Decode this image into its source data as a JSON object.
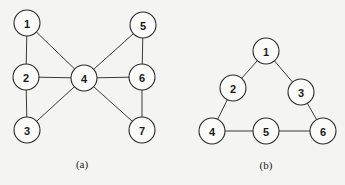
{
  "graphs": [
    {
      "id": "a",
      "caption": "(a)",
      "caption_pos": [
        82,
        164
      ],
      "nodes": [
        {
          "label": "1",
          "x": 27,
          "y": 23
        },
        {
          "label": "2",
          "x": 26,
          "y": 77
        },
        {
          "label": "3",
          "x": 27,
          "y": 130
        },
        {
          "label": "4",
          "x": 84,
          "y": 78
        },
        {
          "label": "5",
          "x": 143,
          "y": 25
        },
        {
          "label": "6",
          "x": 142,
          "y": 77
        },
        {
          "label": "7",
          "x": 142,
          "y": 130
        }
      ],
      "edges": [
        [
          "1",
          "2"
        ],
        [
          "2",
          "3"
        ],
        [
          "1",
          "4"
        ],
        [
          "2",
          "4"
        ],
        [
          "3",
          "4"
        ],
        [
          "4",
          "5"
        ],
        [
          "4",
          "6"
        ],
        [
          "4",
          "7"
        ],
        [
          "5",
          "6"
        ],
        [
          "6",
          "7"
        ]
      ]
    },
    {
      "id": "b",
      "caption": "(b)",
      "caption_pos": [
        266,
        165
      ],
      "nodes": [
        {
          "label": "1",
          "x": 266,
          "y": 51
        },
        {
          "label": "2",
          "x": 233,
          "y": 88
        },
        {
          "label": "3",
          "x": 301,
          "y": 92
        },
        {
          "label": "4",
          "x": 212,
          "y": 131
        },
        {
          "label": "5",
          "x": 266,
          "y": 131
        },
        {
          "label": "6",
          "x": 323,
          "y": 131
        }
      ],
      "edges": [
        [
          "1",
          "2"
        ],
        [
          "1",
          "3"
        ],
        [
          "2",
          "4"
        ],
        [
          "3",
          "6"
        ],
        [
          "4",
          "5"
        ],
        [
          "5",
          "6"
        ]
      ]
    }
  ],
  "node_radius": 13
}
